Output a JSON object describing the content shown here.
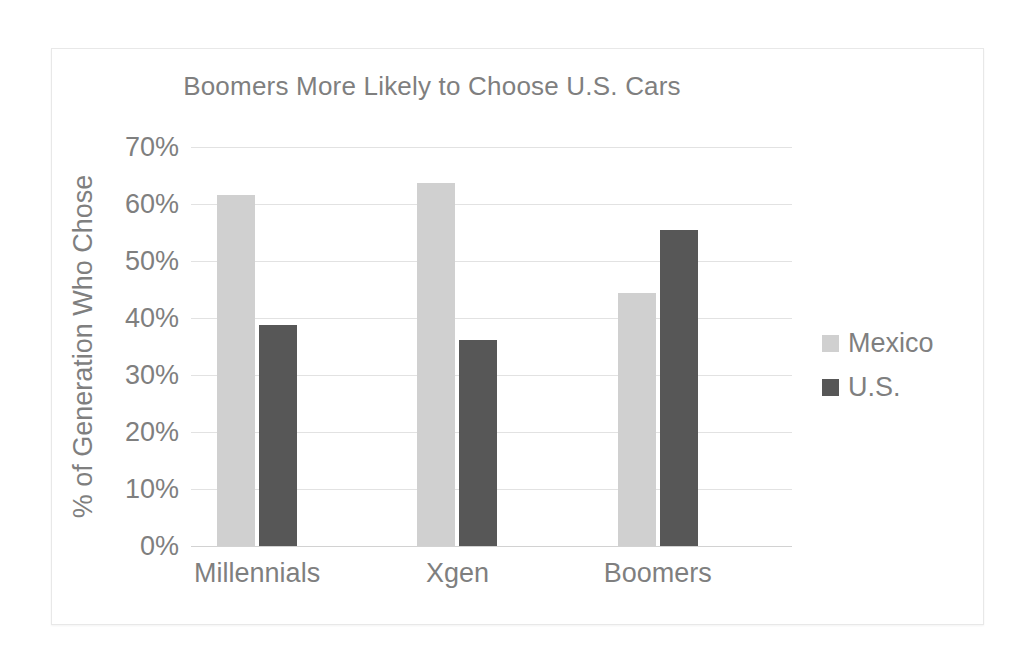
{
  "chart_data": {
    "type": "bar",
    "title": "Boomers More Likely to Choose U.S. Cars",
    "xlabel": "",
    "ylabel": "% of Generation Who Chose",
    "categories": [
      "Millennials",
      "Xgen",
      "Boomers"
    ],
    "series": [
      {
        "name": "Mexico",
        "color": "#d0d0d0",
        "values": [
          61.5,
          63.7,
          44.4
        ]
      },
      {
        "name": "U.S.",
        "color": "#575757",
        "values": [
          38.7,
          36.2,
          55.4
        ]
      }
    ],
    "ylim": [
      0,
      70
    ],
    "ytick_labels": [
      "70%",
      "60%",
      "50%",
      "40%",
      "30%",
      "20%",
      "10%",
      "0%"
    ],
    "ytick_values": [
      70,
      60,
      50,
      40,
      30,
      20,
      10,
      0
    ],
    "grid": true,
    "legend_position": "right",
    "text_color": "#7f7f7f",
    "background_color": "#ffffff",
    "gridline_color": "#e2e2e2"
  }
}
